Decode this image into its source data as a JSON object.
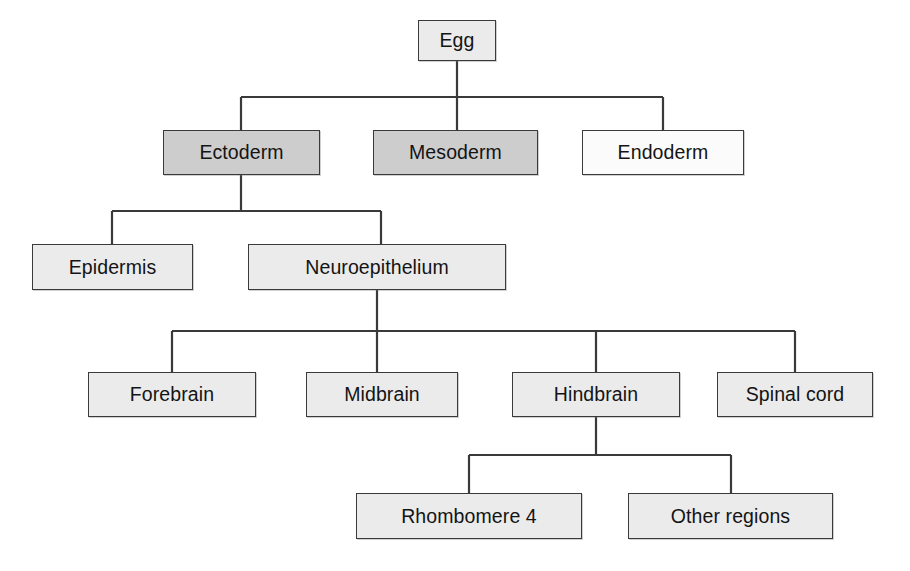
{
  "diagram": {
    "type": "tree-flowchart",
    "colors": {
      "stroke": "#3a3a3a",
      "fill_light": "#ebebeb",
      "fill_medium": "#cdcdcd",
      "fill_white": "#fbfbfb",
      "text": "#141414",
      "background": "#ffffff"
    },
    "nodes": [
      {
        "id": "egg",
        "label": "Egg",
        "level": 0,
        "shade": "light",
        "x": 418,
        "y": 20,
        "w": 78,
        "h": 41
      },
      {
        "id": "ectoderm",
        "label": "Ectoderm",
        "level": 1,
        "shade": "medium",
        "x": 163,
        "y": 130,
        "w": 157,
        "h": 45
      },
      {
        "id": "mesoderm",
        "label": "Mesoderm",
        "level": 1,
        "shade": "medium",
        "x": 373,
        "y": 130,
        "w": 165,
        "h": 45
      },
      {
        "id": "endoderm",
        "label": "Endoderm",
        "level": 1,
        "shade": "white",
        "x": 582,
        "y": 130,
        "w": 162,
        "h": 45
      },
      {
        "id": "epidermis",
        "label": "Epidermis",
        "level": 2,
        "shade": "light",
        "x": 32,
        "y": 244,
        "w": 161,
        "h": 46
      },
      {
        "id": "neuroepithelium",
        "label": "Neuroepithelium",
        "level": 2,
        "shade": "light",
        "x": 248,
        "y": 244,
        "w": 258,
        "h": 46
      },
      {
        "id": "forebrain",
        "label": "Forebrain",
        "level": 3,
        "shade": "light",
        "x": 88,
        "y": 372,
        "w": 168,
        "h": 45
      },
      {
        "id": "midbrain",
        "label": "Midbrain",
        "level": 3,
        "shade": "light",
        "x": 306,
        "y": 372,
        "w": 152,
        "h": 45
      },
      {
        "id": "hindbrain",
        "label": "Hindbrain",
        "level": 3,
        "shade": "light",
        "x": 512,
        "y": 372,
        "w": 168,
        "h": 45
      },
      {
        "id": "spinal_cord",
        "label": "Spinal cord",
        "level": 3,
        "shade": "light",
        "x": 717,
        "y": 372,
        "w": 156,
        "h": 45
      },
      {
        "id": "rhombomere4",
        "label": "Rhombomere 4",
        "level": 4,
        "shade": "light",
        "x": 356,
        "y": 493,
        "w": 226,
        "h": 46
      },
      {
        "id": "other_regions",
        "label": "Other regions",
        "level": 4,
        "shade": "light",
        "x": 628,
        "y": 493,
        "w": 205,
        "h": 46
      }
    ],
    "edges": [
      {
        "from": "egg",
        "to": "ectoderm"
      },
      {
        "from": "egg",
        "to": "mesoderm"
      },
      {
        "from": "egg",
        "to": "endoderm"
      },
      {
        "from": "ectoderm",
        "to": "epidermis"
      },
      {
        "from": "ectoderm",
        "to": "neuroepithelium"
      },
      {
        "from": "neuroepithelium",
        "to": "forebrain"
      },
      {
        "from": "neuroepithelium",
        "to": "midbrain"
      },
      {
        "from": "neuroepithelium",
        "to": "hindbrain"
      },
      {
        "from": "neuroepithelium",
        "to": "spinal_cord"
      },
      {
        "from": "hindbrain",
        "to": "rhombomere4"
      },
      {
        "from": "hindbrain",
        "to": "other_regions"
      }
    ],
    "connector_geometry": [
      {
        "parent": "egg",
        "stem_x": 457,
        "stem_y0": 61,
        "bus_y": 97,
        "bus_x0": 241,
        "bus_x1": 663,
        "children_x": [
          241,
          457,
          663
        ],
        "children_y": 130
      },
      {
        "parent": "ectoderm",
        "stem_x": 241,
        "stem_y0": 175,
        "bus_y": 211,
        "bus_x0": 112,
        "bus_x1": 381,
        "children_x": [
          112,
          381
        ],
        "children_y": 244
      },
      {
        "parent": "neuroepithelium",
        "stem_x": 377,
        "stem_y0": 290,
        "bus_y": 331,
        "bus_x0": 172,
        "bus_x1": 795,
        "children_x": [
          172,
          377,
          596,
          795
        ],
        "children_y": 372
      },
      {
        "parent": "hindbrain",
        "stem_x": 596,
        "stem_y0": 417,
        "bus_y": 455,
        "bus_x0": 469,
        "bus_x1": 731,
        "children_x": [
          469,
          731
        ],
        "children_y": 493
      }
    ]
  }
}
